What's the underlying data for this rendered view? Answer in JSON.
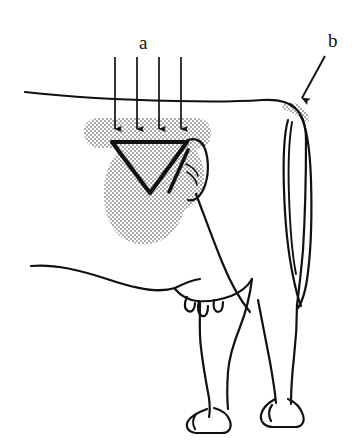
{
  "figure": {
    "background_color": "#ffffff",
    "ink_color": "#111111",
    "shading_color": "#b4b4b4",
    "labels": [
      {
        "id": "a",
        "text": "a",
        "x": 145,
        "y": 44,
        "points_to": "loin-and-rump-shaded-region",
        "marker": "four-down-arrows"
      },
      {
        "id": "b",
        "text": "b",
        "x": 333,
        "y": 40,
        "points_to": "tail-head-shaded-patch",
        "marker": "leader-arrow"
      }
    ],
    "annotations": {
      "arrows_a": {
        "name": "down-arrow-group",
        "count": 4,
        "x_positions": [
          115,
          137,
          159,
          181
        ],
        "y_start": 57,
        "y_end": 131
      },
      "arrow_b": {
        "name": "leader-arrow-b",
        "x_start": 325,
        "y_start": 56,
        "x_end": 300,
        "y_end": 101
      }
    },
    "regions": [
      {
        "name": "loin-band-shading",
        "description": "horizontal stippled band across loin below the topline"
      },
      {
        "name": "rump-blob-shading",
        "description": "oval stippled area over the rump and thigh"
      },
      {
        "name": "triangle-marker",
        "description": "inverted triangle outline over the pin bone region"
      },
      {
        "name": "tail-head-shading",
        "description": "small stippled crescent at the tail head"
      }
    ]
  }
}
